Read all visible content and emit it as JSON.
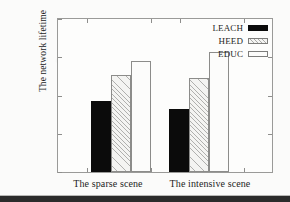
{
  "chart_data": {
    "type": "bar",
    "title": "",
    "subtitle": "",
    "xlabel": "",
    "ylabel": "The network lifetime",
    "categories": [
      "The sparse scene",
      "The intensive scene"
    ],
    "series": [
      {
        "name": "LEACH",
        "values": [
          92,
          81
        ],
        "fill": "solid-black",
        "color": "#0b0b0b"
      },
      {
        "name": "HEED",
        "values": [
          125,
          121
        ],
        "fill": "diagonal-hatch",
        "color": "#f4f4f2"
      },
      {
        "name": "EDUC",
        "values": [
          143,
          155
        ],
        "fill": "plain-white",
        "color": "#fcfcfb"
      }
    ],
    "ylim": [
      0,
      200
    ],
    "yticks": [
      0,
      50,
      100,
      150,
      200
    ],
    "ytick_labels": [
      "0",
      "50",
      "100",
      "150",
      "200"
    ],
    "grid": false,
    "legend_position": "top-right-inside",
    "frame": "box"
  },
  "axes": {
    "y_title": "The network lifetime",
    "y_ticks": [
      {
        "value": 200,
        "label": "200"
      },
      {
        "value": 150,
        "label": "150"
      },
      {
        "value": 100,
        "label": "100"
      },
      {
        "value": 50,
        "label": "50"
      },
      {
        "value": 0,
        "label": "0"
      }
    ],
    "x_groups": [
      {
        "label": "The sparse scene"
      },
      {
        "label": "The intensive scene"
      }
    ]
  },
  "legend": {
    "entries": [
      {
        "label": "LEACH",
        "style": "leach"
      },
      {
        "label": "HEED",
        "style": "heed"
      },
      {
        "label": "EDUC",
        "style": "educ"
      }
    ]
  }
}
